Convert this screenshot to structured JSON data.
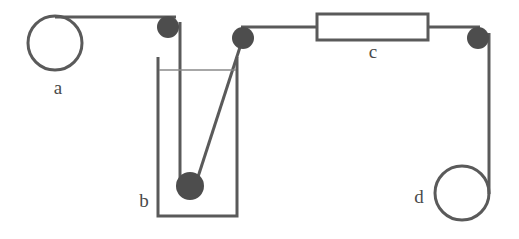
{
  "figure": {
    "background_color": "#ffffff",
    "stroke_color": "#5a5a5a",
    "node_fill_color": "#4d4d4d",
    "label_color": "#4a4a4a",
    "liquid_line_color": "#7a7a7a",
    "stroke_width": 3,
    "thin_stroke_width": 1.6
  },
  "labels": {
    "a": {
      "text": "a",
      "x": 58,
      "y": 90
    },
    "b": {
      "text": "b",
      "x": 144,
      "y": 203
    },
    "c": {
      "text": "c",
      "x": 373,
      "y": 54
    },
    "d": {
      "text": "d",
      "x": 419,
      "y": 199
    }
  },
  "components": {
    "pulley_a": {
      "name": "a",
      "shape": "circle",
      "cx": 55,
      "cy": 43,
      "r": 27,
      "filled": false
    },
    "beaker_b": {
      "name": "b",
      "shape": "open-rectangle",
      "left": 158,
      "right": 237,
      "top": 57,
      "bottom": 216,
      "liquid_level_y": 70
    },
    "block_c": {
      "name": "c",
      "shape": "rectangle",
      "left": 316,
      "right": 428,
      "top": 14,
      "bottom": 40
    },
    "pulley_d": {
      "name": "d",
      "shape": "circle",
      "cx": 462,
      "cy": 193,
      "r": 27,
      "filled": false
    },
    "node_1": {
      "shape": "filled-circle",
      "cx": 168,
      "cy": 27,
      "r": 11
    },
    "node_2": {
      "shape": "filled-circle",
      "cx": 243,
      "cy": 38,
      "r": 11
    },
    "node_3": {
      "shape": "filled-circle",
      "cx": 478,
      "cy": 38,
      "r": 11
    },
    "submerged_ball": {
      "shape": "filled-circle",
      "cx": 190,
      "cy": 186,
      "r": 14
    }
  },
  "strings": {
    "a_to_node1": {
      "from_x": 55,
      "from_y": 17,
      "to_x": 176,
      "to_y": 17
    },
    "node1_to_ball": {
      "from_x": 180,
      "from_y": 22,
      "to_x": 180,
      "to_y": 183
    },
    "ball_to_node2": {
      "from_x": 197,
      "from_y": 179,
      "to_x": 241,
      "to_y": 44
    },
    "node2_to_block_c": {
      "from_x": 243,
      "from_y": 27,
      "to_x": 316,
      "to_y": 27
    },
    "block_c_to_node3": {
      "from_x": 428,
      "from_y": 27,
      "to_x": 479,
      "to_y": 27
    },
    "node3_to_d": {
      "from_x": 489,
      "from_y": 33,
      "to_x": 489,
      "to_y": 193
    }
  }
}
